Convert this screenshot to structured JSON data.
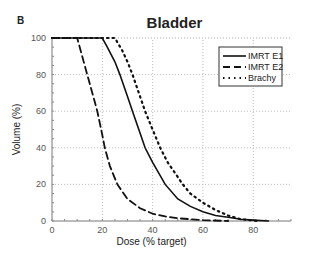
{
  "panel_label": "B",
  "chart_data": {
    "type": "line",
    "title": "Bladder",
    "xlabel": "Dose (% target)",
    "ylabel": "Volume (%)",
    "xlim": [
      0,
      95
    ],
    "ylim": [
      0,
      100
    ],
    "xticks": [
      0,
      20,
      40,
      60,
      80
    ],
    "yticks": [
      0,
      20,
      40,
      60,
      80,
      100
    ],
    "grid": "dotted at major ticks",
    "legend_position": "upper right",
    "series": [
      {
        "name": "IMRT E1",
        "style": "solid",
        "x": [
          0,
          20,
          22,
          25,
          27,
          30,
          32,
          35,
          37,
          40,
          45,
          50,
          55,
          60,
          65,
          70,
          75,
          80,
          86
        ],
        "y": [
          100,
          100,
          95,
          87,
          80,
          68,
          60,
          48,
          40,
          32,
          20,
          12,
          8,
          5,
          3,
          2,
          1,
          0.5,
          0
        ]
      },
      {
        "name": "IMRT E2",
        "style": "dashed",
        "x": [
          0,
          10,
          12,
          14,
          16,
          18,
          20,
          21,
          23,
          26,
          30,
          35,
          40,
          45,
          50,
          55,
          60,
          70
        ],
        "y": [
          100,
          100,
          90,
          80,
          70,
          60,
          47,
          40,
          30,
          20,
          12,
          7,
          4,
          2.5,
          1.5,
          1,
          0.5,
          0
        ]
      },
      {
        "name": "Brachy",
        "style": "dotted",
        "x": [
          0,
          25,
          28,
          30,
          32,
          35,
          37,
          40,
          43,
          46,
          50,
          52,
          55,
          60,
          65,
          70,
          75,
          82
        ],
        "y": [
          100,
          100,
          93,
          87,
          80,
          68,
          60,
          50,
          40,
          32,
          24,
          20,
          15,
          10,
          6,
          3,
          1,
          0
        ]
      }
    ]
  }
}
